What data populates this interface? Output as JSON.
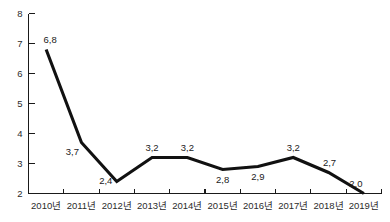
{
  "title_remnant": "",
  "colors": {
    "line": "#111111",
    "axis": "#1a1a1a",
    "text": "#2b2b2b",
    "background": "#ffffff"
  },
  "chart_data": {
    "type": "line",
    "title": "",
    "xlabel": "",
    "ylabel": "",
    "categories": [
      "2010년",
      "2011년",
      "2012년",
      "2013년",
      "2014년",
      "2015년",
      "2016년",
      "2017년",
      "2018년",
      "2019년"
    ],
    "values": [
      6.8,
      3.7,
      2.4,
      3.2,
      3.2,
      2.8,
      2.9,
      3.2,
      2.7,
      2.0
    ],
    "point_labels": [
      "6,8",
      "3,7",
      "2,4",
      "3,2",
      "3,2",
      "2,8",
      "2,9",
      "3,2",
      "2,7",
      "2,0"
    ],
    "ylim": [
      2,
      8
    ],
    "ytick_values": [
      2,
      3,
      4,
      5,
      6,
      7,
      8
    ],
    "ytick_labels": [
      "2",
      "3",
      "4",
      "5",
      "6",
      "7",
      "8"
    ],
    "grid": false,
    "legend": null,
    "label_positions": [
      "above",
      "below",
      "below",
      "above",
      "above",
      "below",
      "below",
      "above",
      "above",
      "above"
    ]
  }
}
